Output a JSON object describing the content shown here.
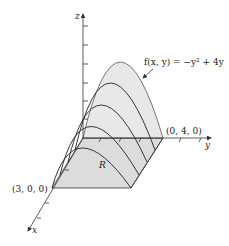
{
  "diagram": {
    "function_label": "f(x, y) = −y² + 4y",
    "axis_labels": {
      "x": "x",
      "y": "y",
      "z": "z"
    },
    "points": {
      "x_intercept": "(3, 0, 0)",
      "y_intercept": "(0, 4, 0)"
    },
    "region_label": "R",
    "colors": {
      "surface_fill": "#e6e6e6",
      "region_fill": "#dcdcdc",
      "line": "#333333"
    }
  }
}
